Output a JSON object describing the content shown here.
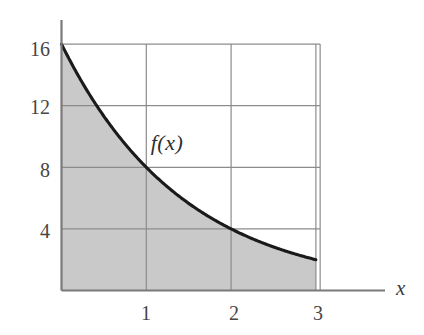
{
  "figure": {
    "background_color": "#ffffff",
    "curve_label": "f(x)",
    "x_axis_label": "x",
    "axis_color": "#7a7a7a",
    "grid_color": "#8c8c8c",
    "curve_color": "#1a1a1a",
    "fill_color": "#c9c9c9"
  },
  "chart_data": {
    "type": "area",
    "title": "",
    "subtitle": "",
    "xlabel": "x",
    "ylabel": "",
    "legend": [],
    "grid": true,
    "legend_position": "none",
    "annotations": [
      {
        "text": "f(x)",
        "x": 1.25,
        "y": 10.4
      }
    ],
    "xlim": [
      0,
      3.6
    ],
    "ylim": [
      0,
      17
    ],
    "xticks": [
      1,
      2,
      3
    ],
    "xtick_labels": [
      "1",
      "2",
      "3"
    ],
    "yticks": [
      4,
      8,
      12,
      16
    ],
    "ytick_labels": [
      "4",
      "8",
      "12",
      "16"
    ],
    "shaded_region": {
      "x_from": 0,
      "x_to": 3,
      "y_from": 0,
      "description": "area under curve from x=0 to x=3"
    },
    "series": [
      {
        "name": "f(x)",
        "formula": "f(x) = 16 * 2^(-x)",
        "x": [
          0,
          0.25,
          0.5,
          0.75,
          1,
          1.25,
          1.5,
          1.75,
          2,
          2.25,
          2.5,
          2.75,
          3
        ],
        "values": [
          16,
          13.45,
          11.31,
          9.51,
          8,
          6.73,
          5.66,
          4.76,
          4,
          3.36,
          2.83,
          2.38,
          2
        ]
      }
    ],
    "key_points": [
      {
        "x": 0,
        "y": 16
      },
      {
        "x": 1,
        "y": 8
      },
      {
        "x": 2,
        "y": 4
      },
      {
        "x": 3,
        "y": 2
      }
    ]
  }
}
